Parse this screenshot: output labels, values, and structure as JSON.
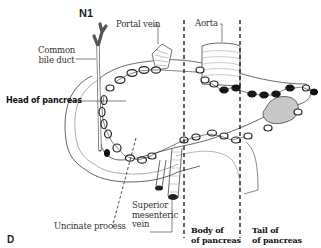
{
  "figure": {
    "title": "N1",
    "panel_letter": "D",
    "labels": {
      "common_bile_duct": [
        "Common",
        "bile duct"
      ],
      "portal_vein": "Portal vein",
      "aorta": "Aorta",
      "head_of_pancreas": "Head of pancreas",
      "uncinate_process": "Uncinate process",
      "superior_mesenteric_vein": [
        "Superior",
        "mesenteric",
        "vein"
      ],
      "body_of_pancreas": [
        "Body of",
        "of pancreas"
      ],
      "tail_of_pancreas": [
        "Tail of",
        "of pancreas"
      ]
    },
    "colors": {
      "line": "#222222",
      "node_open": "#ffffff",
      "node_filled": "#111111",
      "tumor": "#bbbbbb"
    }
  }
}
